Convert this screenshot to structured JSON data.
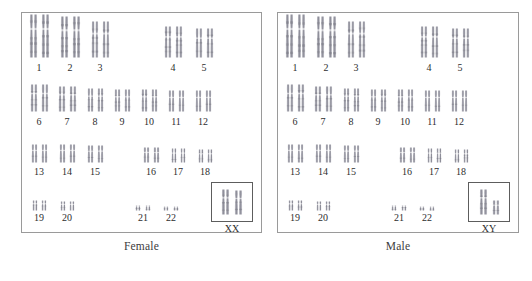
{
  "figure": {
    "type": "karyotype-comparison",
    "background_color": "#ffffff",
    "panel_border_color": "#9a9a9a",
    "chromosome_color": "#9a9aa2",
    "label_color": "#2e2e2e"
  },
  "panels": [
    {
      "id": "female",
      "caption": "Female",
      "sex_chromosomes_label": "XX",
      "rows": [
        {
          "row": 1,
          "cells": [
            {
              "label": "1",
              "height": 44,
              "width": 9,
              "gap": 3
            },
            {
              "label": "2",
              "height": 42,
              "width": 9,
              "gap": 3
            },
            {
              "label": "3",
              "height": 37,
              "width": 8,
              "gap": 3
            },
            {
              "label": "4",
              "height": 32,
              "width": 8,
              "gap": 3
            },
            {
              "label": "5",
              "height": 30,
              "width": 8,
              "gap": 3
            }
          ]
        },
        {
          "row": 2,
          "cells": [
            {
              "label": "6",
              "height": 28,
              "width": 8,
              "gap": 3
            },
            {
              "label": "7",
              "height": 26,
              "width": 8,
              "gap": 3
            },
            {
              "label": "8",
              "height": 24,
              "width": 7,
              "gap": 3
            },
            {
              "label": "9",
              "height": 23,
              "width": 7,
              "gap": 3
            },
            {
              "label": "10",
              "height": 23,
              "width": 7,
              "gap": 3
            },
            {
              "label": "11",
              "height": 22,
              "width": 7,
              "gap": 3
            },
            {
              "label": "12",
              "height": 22,
              "width": 7,
              "gap": 3
            }
          ]
        },
        {
          "row": 3,
          "cells": [
            {
              "label": "13",
              "height": 19,
              "width": 7,
              "gap": 3
            },
            {
              "label": "14",
              "height": 19,
              "width": 7,
              "gap": 3
            },
            {
              "label": "15",
              "height": 18,
              "width": 7,
              "gap": 3
            },
            {
              "label": "16",
              "height": 16,
              "width": 7,
              "gap": 3
            },
            {
              "label": "17",
              "height": 15,
              "width": 6,
              "gap": 3
            },
            {
              "label": "18",
              "height": 14,
              "width": 6,
              "gap": 3
            }
          ]
        },
        {
          "row": 4,
          "cells": [
            {
              "label": "19",
              "height": 11,
              "width": 6,
              "gap": 3
            },
            {
              "label": "20",
              "height": 10,
              "width": 6,
              "gap": 3
            },
            {
              "label": "21",
              "height": 6,
              "width": 6,
              "gap": 4
            },
            {
              "label": "22",
              "height": 5,
              "width": 6,
              "gap": 4
            }
          ]
        }
      ]
    },
    {
      "id": "male",
      "caption": "Male",
      "sex_chromosomes_label": "XY",
      "rows": [
        {
          "row": 1,
          "cells": [
            {
              "label": "1",
              "height": 44,
              "width": 9,
              "gap": 3
            },
            {
              "label": "2",
              "height": 42,
              "width": 9,
              "gap": 3
            },
            {
              "label": "3",
              "height": 37,
              "width": 8,
              "gap": 3
            },
            {
              "label": "4",
              "height": 32,
              "width": 8,
              "gap": 3
            },
            {
              "label": "5",
              "height": 30,
              "width": 8,
              "gap": 3
            }
          ]
        },
        {
          "row": 2,
          "cells": [
            {
              "label": "6",
              "height": 28,
              "width": 8,
              "gap": 3
            },
            {
              "label": "7",
              "height": 26,
              "width": 8,
              "gap": 3
            },
            {
              "label": "8",
              "height": 24,
              "width": 7,
              "gap": 3
            },
            {
              "label": "9",
              "height": 23,
              "width": 7,
              "gap": 3
            },
            {
              "label": "10",
              "height": 23,
              "width": 7,
              "gap": 3
            },
            {
              "label": "11",
              "height": 22,
              "width": 7,
              "gap": 3
            },
            {
              "label": "12",
              "height": 22,
              "width": 7,
              "gap": 3
            }
          ]
        },
        {
          "row": 3,
          "cells": [
            {
              "label": "13",
              "height": 19,
              "width": 7,
              "gap": 3
            },
            {
              "label": "14",
              "height": 19,
              "width": 7,
              "gap": 3
            },
            {
              "label": "15",
              "height": 18,
              "width": 7,
              "gap": 3
            },
            {
              "label": "16",
              "height": 16,
              "width": 7,
              "gap": 3
            },
            {
              "label": "17",
              "height": 15,
              "width": 6,
              "gap": 3
            },
            {
              "label": "18",
              "height": 14,
              "width": 6,
              "gap": 3
            }
          ]
        },
        {
          "row": 4,
          "cells": [
            {
              "label": "19",
              "height": 11,
              "width": 6,
              "gap": 3
            },
            {
              "label": "20",
              "height": 10,
              "width": 6,
              "gap": 3
            },
            {
              "label": "21",
              "height": 6,
              "width": 6,
              "gap": 4
            },
            {
              "label": "22",
              "height": 5,
              "width": 6,
              "gap": 4
            }
          ]
        }
      ]
    }
  ]
}
